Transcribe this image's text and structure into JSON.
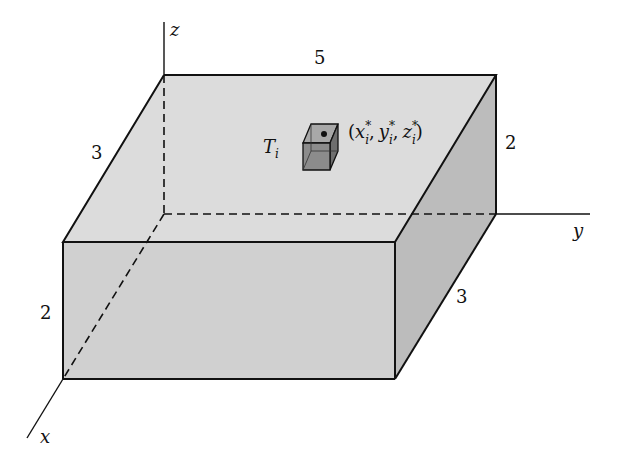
{
  "figure": {
    "type": "3D rectangular box partitioned into sub-boxes",
    "axes": {
      "x_label": "x",
      "y_label": "y",
      "z_label": "z"
    },
    "dimensions": {
      "top_length_label": "5",
      "top_width_label": "3",
      "right_height_label": "2",
      "front_height_label": "2",
      "right_depth_label": "3"
    },
    "sub_box": {
      "name_main": "T",
      "name_sub": "i",
      "point_label_open": "(",
      "point_x": "x",
      "point_y": "y",
      "point_z": "z",
      "sub": "i",
      "star": "*",
      "sep": ",",
      "point_label_close": ")"
    },
    "colors": {
      "top_face": "#dcdcdc",
      "front_face": "#cfcfcf",
      "side_face": "#bdbdbd",
      "small_cube": "#8a8a8a",
      "line": "#111111"
    }
  }
}
